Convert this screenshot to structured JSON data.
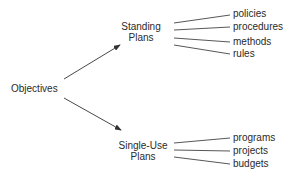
{
  "diagram": {
    "root": {
      "label": "Objectives"
    },
    "branches": [
      {
        "label_line1": "Standing",
        "label_line2": "Plans",
        "leaves": [
          "policies",
          "procedures",
          "methods",
          "rules"
        ]
      },
      {
        "label_line1": "Single-Use",
        "label_line2": "Plans",
        "leaves": [
          "programs",
          "projects",
          "budgets"
        ]
      }
    ],
    "colors": {
      "line": "#333333",
      "text": "#2a2a2a",
      "background": "#ffffff"
    }
  }
}
